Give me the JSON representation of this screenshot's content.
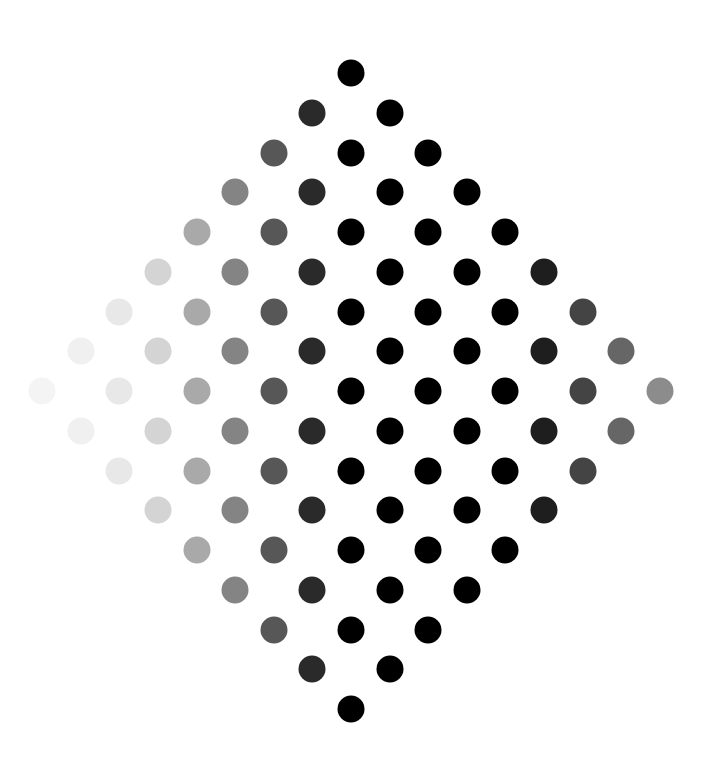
{
  "figure": {
    "grid_size": 9,
    "origin": {
      "x": 351,
      "y": 73
    },
    "step": {
      "x": 38.6,
      "y": 39.75
    },
    "dot_diameter": 27,
    "column_shades": [
      "#f4f4f4",
      "#f0f0f0",
      "#e8e8e8",
      "#d4d4d4",
      "#a9a9a9",
      "#848484",
      "#575757",
      "#2a2a2a",
      "#000000",
      "#000000",
      "#000000",
      "#000000",
      "#000000",
      "#1e1e1e",
      "#444444",
      "#666666",
      "#8c8c8c"
    ],
    "background": "#ffffff"
  }
}
